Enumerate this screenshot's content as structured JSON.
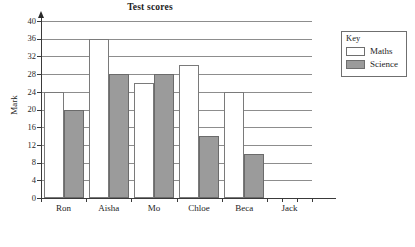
{
  "chart_data": {
    "type": "bar",
    "title": "Test scores",
    "xlabel": "",
    "ylabel": "Mark",
    "categories": [
      "Ron",
      "Aisha",
      "Mo",
      "Chloe",
      "Beca",
      "Jack"
    ],
    "series": [
      {
        "name": "Maths",
        "color": "#ffffff",
        "values": [
          24,
          36,
          26,
          30,
          24,
          null
        ]
      },
      {
        "name": "Science",
        "color": "#9b9b9b",
        "values": [
          20,
          28,
          28,
          14,
          10,
          null
        ]
      }
    ],
    "ylim": [
      0,
      40
    ],
    "yticks": [
      0,
      4,
      8,
      12,
      16,
      20,
      24,
      28,
      32,
      36,
      40
    ],
    "ytick_labels": [
      "0",
      "4",
      "8",
      "12",
      "16",
      "20",
      "24",
      "28",
      "32",
      "36",
      "40"
    ],
    "grid": true,
    "grid_axis": "y",
    "legend_position": "right",
    "legend_title": "Key"
  },
  "legend": {
    "title": "Key",
    "entries": [
      {
        "label": "Maths",
        "swatch": "white-swatch"
      },
      {
        "label": "Science",
        "swatch": "gray-swatch"
      }
    ]
  },
  "axes": {
    "y_title": "Mark",
    "y_tick_labels": [
      "40",
      "36",
      "32",
      "28",
      "24",
      "20",
      "16",
      "12",
      "8",
      "4",
      "0"
    ],
    "x_tick_labels": [
      "Ron",
      "Aisha",
      "Mo",
      "Chloe",
      "Beca",
      "Jack"
    ]
  }
}
